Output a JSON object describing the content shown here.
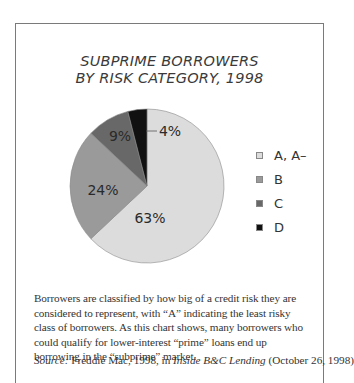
{
  "chart_data": {
    "type": "pie",
    "title_lines": [
      "SUBPRIME BORROWERS",
      "BY RISK CATEGORY, 1998"
    ],
    "categories": [
      "A, A–",
      "B",
      "C",
      "D"
    ],
    "values": [
      63,
      24,
      9,
      4
    ],
    "labels": [
      "63%",
      "24%",
      "9%",
      "4%"
    ],
    "colors": [
      "#dcdcdc",
      "#9a9a9a",
      "#686868",
      "#111111"
    ],
    "start_angle": "12 o'clock, clockwise",
    "legend_position": "right"
  },
  "caption": {
    "text": "Borrowers are classified by how big of a credit risk they are considered to represent, with “A” indicating the least risky class of borrowers. As this chart shows, many borrowers who could qualify for lower-interest “prime” loans end up borrowing in the “subprime” market.",
    "source_label": "Source:",
    "source_pre": " Freddie Mac, 1998, in ",
    "source_pub": "Inside B&C Lending",
    "source_post": " (October 26, 1998)"
  }
}
